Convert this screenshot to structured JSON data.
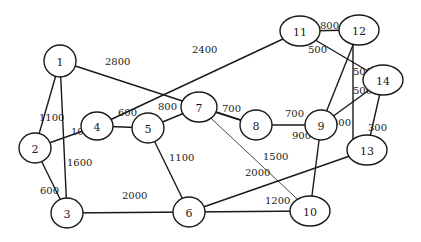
{
  "diagram": {
    "type": "weighted-undirected-graph",
    "nodes": [
      {
        "id": "1",
        "label": "1"
      },
      {
        "id": "2",
        "label": "2"
      },
      {
        "id": "3",
        "label": "3"
      },
      {
        "id": "4",
        "label": "4"
      },
      {
        "id": "5",
        "label": "5"
      },
      {
        "id": "6",
        "label": "6"
      },
      {
        "id": "7",
        "label": "7"
      },
      {
        "id": "8",
        "label": "8"
      },
      {
        "id": "9",
        "label": "9"
      },
      {
        "id": "10",
        "label": "10"
      },
      {
        "id": "11",
        "label": "11"
      },
      {
        "id": "12",
        "label": "12"
      },
      {
        "id": "13",
        "label": "13"
      },
      {
        "id": "14",
        "label": "14"
      }
    ],
    "edges": [
      {
        "from": "1",
        "to": "2",
        "weight": "1100"
      },
      {
        "from": "1",
        "to": "3",
        "weight": "1600"
      },
      {
        "from": "1",
        "to": "8",
        "weight": "2800"
      },
      {
        "from": "2",
        "to": "3",
        "weight": "600"
      },
      {
        "from": "2",
        "to": "4",
        "weight": "1000"
      },
      {
        "from": "4",
        "to": "5",
        "weight": "600"
      },
      {
        "from": "4",
        "to": "11",
        "weight": "2400"
      },
      {
        "from": "5",
        "to": "7",
        "weight": "800"
      },
      {
        "from": "5",
        "to": "6",
        "weight": "1100"
      },
      {
        "from": "7",
        "to": "8",
        "weight": "700"
      },
      {
        "from": "7",
        "to": "10",
        "weight": "1500"
      },
      {
        "from": "8",
        "to": "9",
        "weight": "700"
      },
      {
        "from": "9",
        "to": "12",
        "weight": "500"
      },
      {
        "from": "9",
        "to": "14",
        "weight": "500"
      },
      {
        "from": "9",
        "to": "10",
        "weight": "900"
      },
      {
        "from": "11",
        "to": "12",
        "weight": "800"
      },
      {
        "from": "11",
        "to": "14",
        "weight": "500"
      },
      {
        "from": "12",
        "to": "13",
        "weight": "300"
      },
      {
        "from": "13",
        "to": "14",
        "weight": "300"
      },
      {
        "from": "3",
        "to": "6",
        "weight": "2000"
      },
      {
        "from": "6",
        "to": "10",
        "weight": "1200"
      },
      {
        "from": "6",
        "to": "13",
        "weight": "2000"
      }
    ]
  }
}
